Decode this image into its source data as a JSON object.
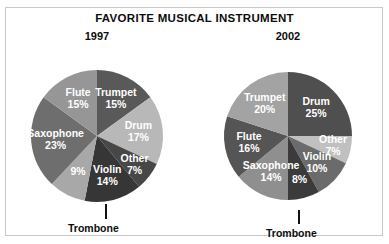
{
  "title": "FAVORITE MUSICAL INSTRUMENT",
  "callouts": {
    "trombone_1997": "Trombone",
    "trombone_2002": "Trombone"
  },
  "chart_data": [
    {
      "type": "pie",
      "title": "1997",
      "year": "1997",
      "legend": "none",
      "categories": [
        "Trumpet",
        "Drum",
        "Other",
        "Violin",
        "Trombone",
        "Saxophone",
        "Flute"
      ],
      "values": [
        15,
        17,
        7,
        14,
        9,
        23,
        15
      ],
      "labels": [
        "Trumpet",
        "Drum",
        "Other",
        "Violin",
        "Trombone",
        "Saxophone",
        "Flute"
      ],
      "value_labels": [
        "15%",
        "17%",
        "7%",
        "14%",
        "9%",
        "23%",
        "15%"
      ],
      "colors": [
        "#595959",
        "#b8b8b8",
        "#474747",
        "#363636",
        "#a8a8a8",
        "#6e6e6e",
        "#969696"
      ],
      "callout_slices": [
        "Trombone"
      ],
      "start_angle": -90,
      "direction": "clockwise",
      "units": "percent"
    },
    {
      "type": "pie",
      "title": "2002",
      "year": "2002",
      "legend": "none",
      "categories": [
        "Drum",
        "Other",
        "Violin",
        "Trombone",
        "Saxophone",
        "Flute",
        "Trumpet"
      ],
      "values": [
        25,
        7,
        10,
        8,
        14,
        16,
        20
      ],
      "labels": [
        "Drum",
        "Other",
        "Violin",
        "Trombone",
        "Saxophone",
        "Flute",
        "Trumpet"
      ],
      "value_labels": [
        "25%",
        "7%",
        "10%",
        "8%",
        "14%",
        "16%",
        "20%"
      ],
      "colors": [
        "#4f4f4f",
        "#c0c0c0",
        "#6b6b6b",
        "#3b3b3b",
        "#8f8f8f",
        "#555555",
        "#a3a3a3"
      ],
      "callout_slices": [
        "Trombone"
      ],
      "start_angle": -90,
      "direction": "clockwise",
      "units": "percent"
    }
  ],
  "geometry": {
    "pie_1997": {
      "cx": 77,
      "cy": 88,
      "r": 66,
      "label_radius_factor": 0.63
    },
    "pie_2002": {
      "cx": 76,
      "cy": 88,
      "r": 64,
      "label_radius_factor": 0.62
    }
  }
}
